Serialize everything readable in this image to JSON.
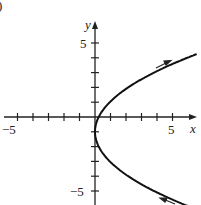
{
  "chart_data": {
    "type": "line",
    "title": "",
    "xlabel": "x",
    "ylabel": "y",
    "xlim": [
      -5.8,
      6.3
    ],
    "ylim": [
      -6,
      6.3
    ],
    "x_tick_labels": [
      "-5",
      "5"
    ],
    "y_tick_labels": [
      "5",
      "-5"
    ],
    "x_ticks": [
      -5,
      -4,
      -3,
      -2,
      -1,
      1,
      2,
      3,
      4,
      5
    ],
    "y_ticks": [
      -5,
      -4,
      -3,
      -2,
      -1,
      1,
      2,
      3,
      4,
      5
    ],
    "grid": false,
    "series": [
      {
        "name": "parametric curve (parabola opening right)",
        "x": [
          5.95,
          3.8,
          2.14,
          0.95,
          0.24,
          0.0,
          0.24,
          0.95,
          2.14,
          3.8,
          5.95
        ],
        "y": [
          -6,
          -5,
          -4,
          -3,
          -2,
          -1,
          0,
          1,
          2,
          3,
          4
        ],
        "direction_arrows": "upper branch arrow points up-right; lower branch arrow points up-left (toward vertex)"
      }
    ],
    "annotations": [
      "partial label ')' at top-left corner"
    ]
  },
  "labels": {
    "corner": ")",
    "x_axis": "x",
    "y_axis": "y",
    "x_min": "−5",
    "x_max": "5",
    "y_max": "5",
    "y_min": "−5"
  }
}
